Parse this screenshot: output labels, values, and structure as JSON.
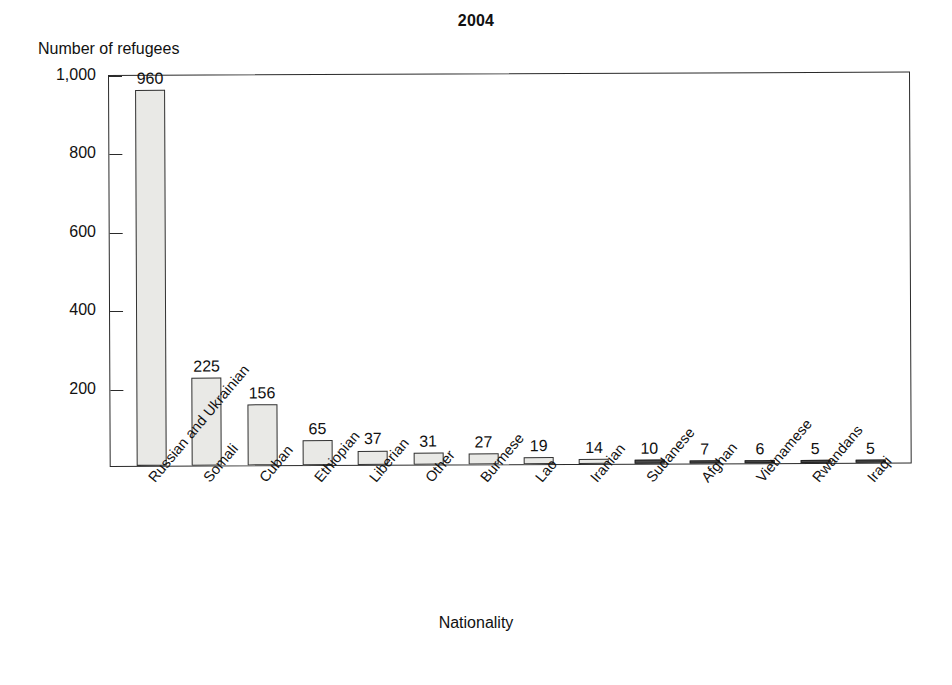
{
  "chart_data": {
    "type": "bar",
    "title": "2004",
    "xlabel": "Nationality",
    "ylabel": "Number of refugees",
    "categories": [
      "Russian and Ukrainian",
      "Somali",
      "Cuban",
      "Ethiopian",
      "Liberian",
      "Other",
      "Burmese",
      "Lao",
      "Iranian",
      "Sudanese",
      "Afghan",
      "Vietnamese",
      "Rwandans",
      "Iraqi"
    ],
    "values": [
      960,
      225,
      156,
      65,
      37,
      31,
      27,
      19,
      14,
      10,
      7,
      6,
      5,
      5
    ],
    "ylim": [
      0,
      1000
    ],
    "yticks": [
      200,
      400,
      600,
      800,
      1000
    ],
    "ytick_labels": [
      "200",
      "400",
      "600",
      "800",
      "1,000"
    ],
    "grid": false,
    "legend": false,
    "bar_fill": "#e9e9e6",
    "bar_edge": "#333333",
    "axis_color": "#2a2a2a",
    "value_labels_shown": true
  }
}
